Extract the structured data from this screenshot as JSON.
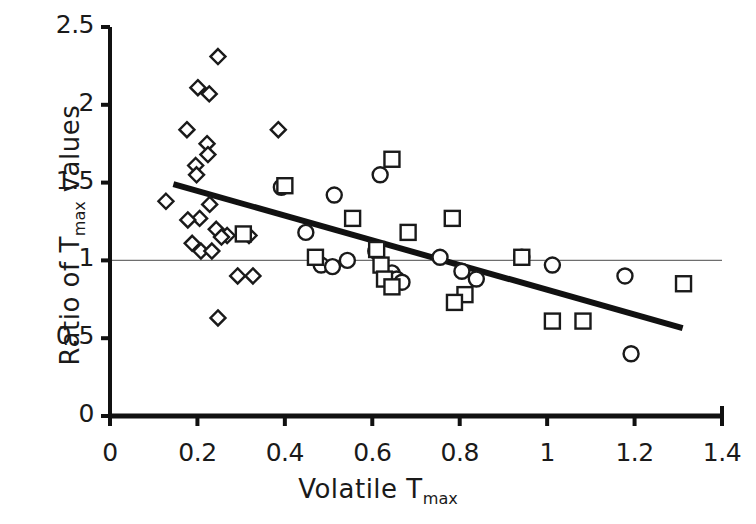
{
  "chart_data": {
    "type": "scatter",
    "title": "",
    "xlabel": "Volatile Tmax",
    "ylabel": "Ratio of Tmax values",
    "xlabel_main": "Volatile T",
    "xlabel_sub": "max",
    "ylabel_main_a": "Ratio of  T",
    "ylabel_sub": "max",
    "ylabel_main_b": " values",
    "xlim": [
      0,
      1.4
    ],
    "ylim": [
      0,
      2.5
    ],
    "xticks": [
      0,
      0.2,
      0.4,
      0.6,
      0.8,
      1.0,
      1.2,
      1.4
    ],
    "xtick_labels": [
      "0",
      "0.2",
      "0.4",
      "0.6",
      "0.8",
      "1",
      "1.2",
      "1.4"
    ],
    "yticks": [
      0,
      0.5,
      1.0,
      1.5,
      2.0,
      2.5
    ],
    "ytick_labels": [
      "0",
      "0.5",
      "1",
      "1.5",
      "2",
      "2.5"
    ],
    "grid": false,
    "legend": "none",
    "marker_color": "#1a1a1a",
    "marker_fill": "#ffffff",
    "reference_line": {
      "name": "unity-line",
      "y": 1.0,
      "x_from": 0.0,
      "x_to": 1.4,
      "color": "#6e6e6e",
      "style": "thin-solid"
    },
    "trend_line": {
      "name": "regression-line",
      "x_from": 0.145,
      "y_from": 1.49,
      "x_to": 1.31,
      "y_to": 0.565,
      "color": "#111111",
      "width_px": 6
    },
    "series": [
      {
        "name": "diamonds",
        "marker": "diamond",
        "points": [
          [
            0.247,
            2.31
          ],
          [
            0.201,
            2.11
          ],
          [
            0.227,
            2.07
          ],
          [
            0.176,
            1.84
          ],
          [
            0.222,
            1.75
          ],
          [
            0.224,
            1.68
          ],
          [
            0.196,
            1.61
          ],
          [
            0.198,
            1.55
          ],
          [
            0.385,
            1.84
          ],
          [
            0.128,
            1.38
          ],
          [
            0.228,
            1.36
          ],
          [
            0.205,
            1.27
          ],
          [
            0.178,
            1.26
          ],
          [
            0.243,
            1.2
          ],
          [
            0.268,
            1.16
          ],
          [
            0.255,
            1.15
          ],
          [
            0.318,
            1.16
          ],
          [
            0.188,
            1.11
          ],
          [
            0.208,
            1.06
          ],
          [
            0.233,
            1.06
          ],
          [
            0.292,
            0.9
          ],
          [
            0.327,
            0.9
          ],
          [
            0.247,
            0.63
          ]
        ]
      },
      {
        "name": "circles",
        "marker": "circle",
        "points": [
          [
            0.392,
            1.47
          ],
          [
            0.513,
            1.42
          ],
          [
            0.618,
            1.55
          ],
          [
            0.448,
            1.18
          ],
          [
            0.483,
            0.97
          ],
          [
            0.509,
            0.96
          ],
          [
            0.543,
            1.0
          ],
          [
            0.608,
            1.06
          ],
          [
            0.645,
            0.92
          ],
          [
            0.656,
            0.88
          ],
          [
            0.668,
            0.86
          ],
          [
            0.755,
            1.02
          ],
          [
            0.805,
            0.93
          ],
          [
            0.838,
            0.88
          ],
          [
            0.942,
            1.02
          ],
          [
            1.012,
            0.97
          ],
          [
            1.178,
            0.9
          ],
          [
            1.192,
            0.4
          ]
        ]
      },
      {
        "name": "squares",
        "marker": "square",
        "points": [
          [
            0.4,
            1.48
          ],
          [
            0.645,
            1.65
          ],
          [
            0.305,
            1.17
          ],
          [
            0.47,
            1.02
          ],
          [
            0.555,
            1.27
          ],
          [
            0.61,
            1.07
          ],
          [
            0.62,
            0.97
          ],
          [
            0.628,
            0.88
          ],
          [
            0.645,
            0.83
          ],
          [
            0.682,
            1.18
          ],
          [
            0.783,
            1.27
          ],
          [
            0.812,
            0.78
          ],
          [
            0.788,
            0.73
          ],
          [
            0.942,
            1.02
          ],
          [
            1.012,
            0.61
          ],
          [
            1.082,
            0.61
          ],
          [
            1.312,
            0.85
          ]
        ]
      }
    ]
  },
  "axes": {
    "name": "cartesian-axes",
    "x_origin_px": 110,
    "y_origin_px": 416,
    "x_end_px": 722,
    "y_top_px": 27,
    "axis_color": "#111111"
  }
}
